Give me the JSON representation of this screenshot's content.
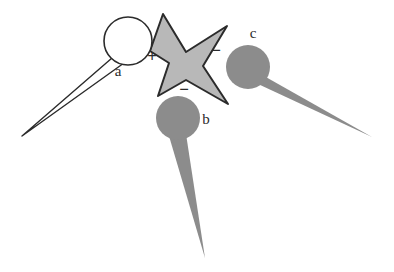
{
  "figure": {
    "background_color": "#ffffff",
    "width": 394,
    "height": 272,
    "outline_color": "#2b2b2b",
    "star_fill": "#b8b8b8",
    "blob_fill": "#8c8c8c",
    "tail_fill": "#8c8c8c",
    "open_fill": "#ffffff"
  },
  "objects": [
    {
      "id": "a",
      "label": "a",
      "style": "open",
      "fill": "#ffffff",
      "stroke": "#2b2b2b",
      "head": {
        "cx": 128,
        "cy": 41,
        "r": 24
      },
      "label_pos": {
        "x": 118,
        "y": 76
      },
      "tail_tip": {
        "x": 22,
        "y": 136
      }
    },
    {
      "id": "b",
      "label": "b",
      "style": "filled",
      "fill": "#8c8c8c",
      "stroke": "none",
      "head": {
        "cx": 178,
        "cy": 118,
        "r": 22
      },
      "label_pos": {
        "x": 206,
        "y": 124
      },
      "tail_tip": {
        "x": 205,
        "y": 258
      }
    },
    {
      "id": "c",
      "label": "c",
      "style": "filled",
      "fill": "#8c8c8c",
      "stroke": "none",
      "head": {
        "cx": 248,
        "cy": 67,
        "r": 22
      },
      "label_pos": {
        "x": 253,
        "y": 38
      },
      "tail_tip": {
        "x": 372,
        "y": 137
      }
    }
  ],
  "star": {
    "id": "star",
    "fill": "#b8b8b8",
    "stroke": "#2b2b2b",
    "points": 4,
    "bbox": {
      "x": 150,
      "y": 13,
      "width": 78,
      "height": 92
    }
  },
  "signs": [
    {
      "id": "sign-plus",
      "symbol": "+",
      "x": 152,
      "y": 62
    },
    {
      "id": "sign-minus-right",
      "symbol": "−",
      "x": 216,
      "y": 56
    },
    {
      "id": "sign-minus-bottom",
      "symbol": "−",
      "x": 184,
      "y": 95
    }
  ]
}
